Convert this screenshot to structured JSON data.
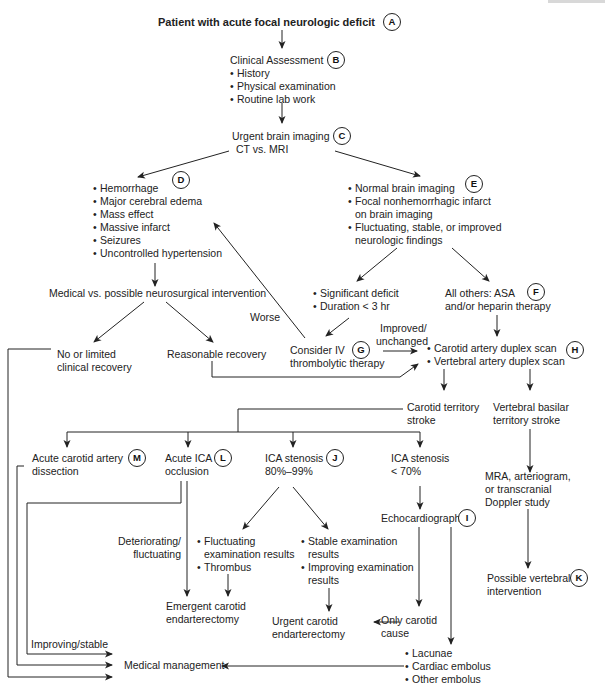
{
  "title": "Patient with acute focal neurologic deficit",
  "nodes": {
    "A": {
      "badge": "A",
      "title": "Patient with acute focal neurologic deficit"
    },
    "B": {
      "badge": "B",
      "title": "Clinical Assessment",
      "items": [
        "History",
        "Physical examination",
        "Routine lab work"
      ]
    },
    "C": {
      "badge": "C",
      "title": "Urgent brain imaging",
      "subtitle": "CT vs. MRI"
    },
    "D": {
      "badge": "D",
      "items": [
        "Hemorrhage",
        "Major cerebral edema",
        "Mass effect",
        "Massive infarct",
        "Seizures",
        "Uncontrolled hypertension"
      ]
    },
    "E": {
      "badge": "E",
      "items": [
        {
          "l1": "Normal brain imaging"
        },
        {
          "l1": "Focal nonhemorrhagic infarct",
          "l2": "on brain imaging"
        },
        {
          "l1": "Fluctuating, stable, or improved",
          "l2": "neurologic findings"
        }
      ]
    },
    "medical_vs_surgical": {
      "title": "Medical vs. possible neurosurgical intervention"
    },
    "no_recovery": {
      "l1": "No or limited",
      "l2": "clinical recovery"
    },
    "reasonable_recovery": {
      "title": "Reasonable recovery"
    },
    "significant": {
      "items": [
        "Significant deficit",
        "Duration < 3 hr"
      ]
    },
    "F": {
      "badge": "F",
      "l1": "All others: ASA",
      "l2": "and/or heparin therapy"
    },
    "G": {
      "badge": "G",
      "l1": "Consider IV",
      "l2": "thrombolytic therapy"
    },
    "H": {
      "badge": "H",
      "items": [
        "Carotid artery duplex scan",
        "Vertebral artery duplex scan"
      ]
    },
    "carotid_stroke": {
      "l1": "Carotid territory",
      "l2": "stroke"
    },
    "vertebral_stroke": {
      "l1": "Vertebral basilar",
      "l2": "territory stroke"
    },
    "M": {
      "badge": "M",
      "l1": "Acute carotid artery",
      "l2": "dissection"
    },
    "L": {
      "badge": "L",
      "l1": "Acute ICA",
      "l2": "occlusion"
    },
    "J": {
      "badge": "J",
      "l1": "ICA stenosis",
      "l2": "80%–99%"
    },
    "ica_lt70": {
      "l1": "ICA stenosis",
      "l2": "< 70%"
    },
    "I": {
      "badge": "I",
      "title": "Echocardiography"
    },
    "mra": {
      "l1": "MRA, arteriogram,",
      "l2": "or transcranial",
      "l3": "Doppler study"
    },
    "K": {
      "badge": "K",
      "l1": "Possible vertebral",
      "l2": "intervention"
    },
    "fluctuating": {
      "items": [
        {
          "l1": "Fluctuating",
          "l2": "examination results"
        },
        {
          "l1": "Thrombus"
        }
      ]
    },
    "stable": {
      "items": [
        {
          "l1": "Stable examination",
          "l2": "results"
        },
        {
          "l1": "Improving examination",
          "l2": "results"
        }
      ]
    },
    "emergent_cea": {
      "l1": "Emergent carotid",
      "l2": "endarterectomy"
    },
    "urgent_cea": {
      "l1": "Urgent carotid",
      "l2": "endarterectomy"
    },
    "only_carotid": {
      "l1": "Only carotid",
      "l2": "cause"
    },
    "medical_management": {
      "title": "Medical management"
    },
    "embolus": {
      "items": [
        "Lacunae",
        "Cardiac embolus",
        "Other embolus"
      ]
    }
  },
  "edge_labels": {
    "worse": "Worse",
    "improved": {
      "l1": "Improved/",
      "l2": "unchanged"
    },
    "deteriorating": {
      "l1": "Deteriorating/",
      "l2": "fluctuating"
    },
    "improving_stable": "Improving/stable"
  },
  "colors": {
    "line": "#222222",
    "text": "#222222",
    "background": "#ffffff"
  }
}
